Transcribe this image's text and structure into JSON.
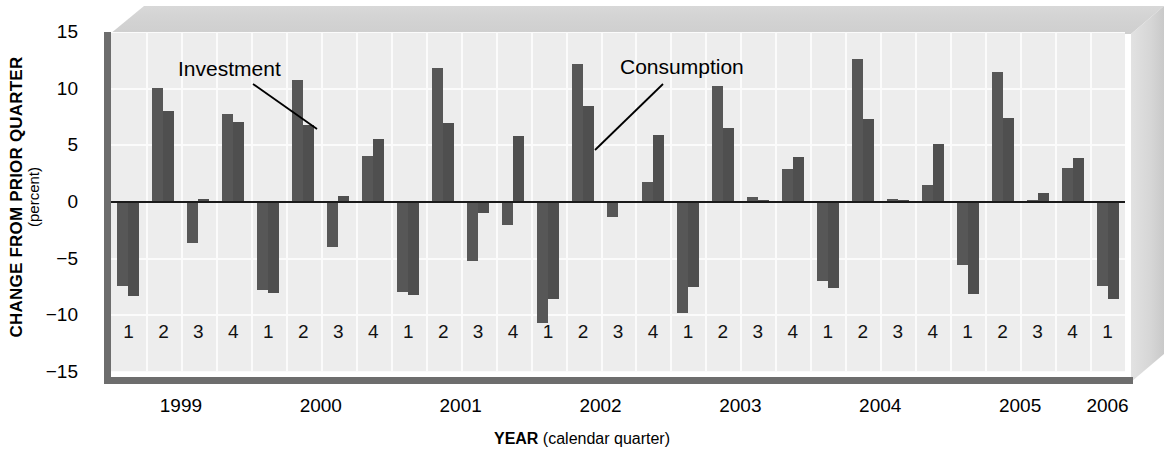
{
  "chart_data": {
    "type": "bar",
    "title": "",
    "xlabel_bold": "YEAR",
    "xlabel_rest": " (calendar quarter)",
    "ylabel": "CHANGE FROM PRIOR QUARTER",
    "ylabel_units": "(percent)",
    "ylim": [
      -15,
      15
    ],
    "yticks": [
      15,
      10,
      5,
      0,
      -5,
      -10,
      -15
    ],
    "ytick_labels": [
      "15",
      "10",
      "5",
      "0",
      "−5",
      "−10",
      "−15"
    ],
    "grid": true,
    "legend_position": "inline-annotation",
    "bar_color": "#575757",
    "plot_bg": "#ededed",
    "gridline_color": "#fbfbfb",
    "years": [
      "1999",
      "2000",
      "2001",
      "2002",
      "2003",
      "2004",
      "2005",
      "2006"
    ],
    "quarter_labels": [
      "1",
      "2",
      "3",
      "4",
      "1",
      "2",
      "3",
      "4",
      "1",
      "2",
      "3",
      "4",
      "1",
      "2",
      "3",
      "4",
      "1",
      "2",
      "3",
      "4",
      "1",
      "2",
      "3",
      "4",
      "1",
      "2",
      "3",
      "4",
      "1"
    ],
    "categories": [
      "1999 Q1",
      "1999 Q2",
      "1999 Q3",
      "1999 Q4",
      "2000 Q1",
      "2000 Q2",
      "2000 Q3",
      "2000 Q4",
      "2001 Q1",
      "2001 Q2",
      "2001 Q3",
      "2001 Q4",
      "2002 Q1",
      "2002 Q2",
      "2002 Q3",
      "2002 Q4",
      "2003 Q1",
      "2003 Q2",
      "2003 Q3",
      "2003 Q4",
      "2004 Q1",
      "2004 Q2",
      "2004 Q3",
      "2004 Q4",
      "2005 Q1",
      "2005 Q2",
      "2005 Q3",
      "2005 Q4",
      "2006 Q1"
    ],
    "series": [
      {
        "name": "Investment",
        "values": [
          -7.4,
          10.1,
          -3.6,
          7.8,
          -7.8,
          10.8,
          -4.0,
          4.1,
          -7.9,
          11.8,
          -5.2,
          -2.0,
          -10.7,
          12.2,
          -1.3,
          1.8,
          -9.8,
          10.2,
          0.4,
          2.9,
          -7.0,
          12.6,
          0.3,
          1.5,
          -5.6,
          11.5,
          0.2,
          3.0,
          -7.4
        ]
      },
      {
        "name": "Consumption",
        "values": [
          -8.3,
          8.0,
          0.3,
          7.1,
          -8.0,
          6.8,
          0.5,
          5.6,
          -8.2,
          7.0,
          -1.0,
          5.8,
          -8.6,
          8.5,
          0.0,
          5.9,
          -7.5,
          6.5,
          0.2,
          4.0,
          -7.6,
          7.3,
          0.2,
          5.1,
          -8.1,
          7.4,
          0.8,
          3.9,
          -8.6
        ]
      }
    ],
    "annotations": [
      {
        "label": "Investment",
        "text_x": 178,
        "text_y": 58,
        "line_x1": 253,
        "line_y1": 84,
        "line_x2": 317,
        "line_y2": 129
      },
      {
        "label": "Consumption",
        "text_x": 620,
        "text_y": 56,
        "line_x1": 663,
        "line_y1": 84,
        "line_x2": 595,
        "line_y2": 150
      }
    ]
  }
}
